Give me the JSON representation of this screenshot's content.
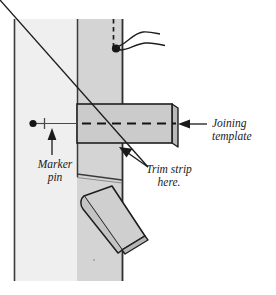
{
  "figure": {
    "labels": {
      "joining_template": "Joining\ntemplate",
      "marker_pin": "Marker\npin",
      "trim_strip_here": "Trim strip\nhere."
    },
    "cut_off_caption": "",
    "colors": {
      "background": "#ffffff",
      "panel_left": "#eeeeee",
      "panel_overlap": "#d2d2d2",
      "template_face": "#cccccc",
      "template_edge": "#b4b4b4",
      "flap_face": "#cfcfcf",
      "flap_edge": "#bdbdbd",
      "outline": "#1a1a1a",
      "text": "#1a1a1a"
    },
    "parts": {
      "left_panel": "left wallcovering panel",
      "overlap_strip": "overlapping panel strip",
      "template": "joining template straightedge",
      "center_line": "dashed alignment centerline",
      "pin": "marker pin with gauge line",
      "flap": "trimmed strip peeled away",
      "dashed_guide": "dashed vertical guideline",
      "curved_leader": "curved leader lines"
    }
  }
}
